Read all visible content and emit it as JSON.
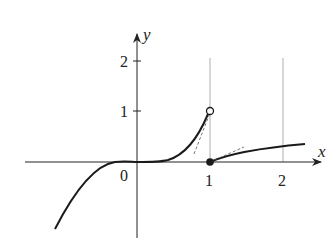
{
  "figure": {
    "type": "function-graph",
    "axes": {
      "x_label": "x",
      "y_label": "y",
      "origin_label": "0",
      "x_ticks": [
        "1",
        "2"
      ],
      "y_ticks": [
        "1",
        "2"
      ]
    },
    "markers": {
      "open_point": {
        "x": 1,
        "y": 1,
        "label": "open circle (excluded)"
      },
      "closed_point": {
        "x": 1,
        "y": 0,
        "label": "filled dot (included)"
      }
    },
    "pieces": [
      {
        "name": "cubic-left",
        "domain": "x < 0",
        "shape": "flat near origin, descending to lower left"
      },
      {
        "name": "cubic-right",
        "domain": "0 <= x < 1",
        "shape": "rises to (1,1) with open endpoint"
      },
      {
        "name": "slow-growth",
        "domain": "x >= 1",
        "shape": "starts at (1,0), concave increasing"
      }
    ],
    "tangent_lines": [
      "dashed tangent at left approach to x=1",
      "dashed tangent at right start x=1"
    ],
    "vertical_guides": [
      1,
      2
    ],
    "colors": {
      "curve": "#1a1a1a",
      "axis": "#222222",
      "guide": "#888888",
      "dashed": "#555555"
    }
  }
}
